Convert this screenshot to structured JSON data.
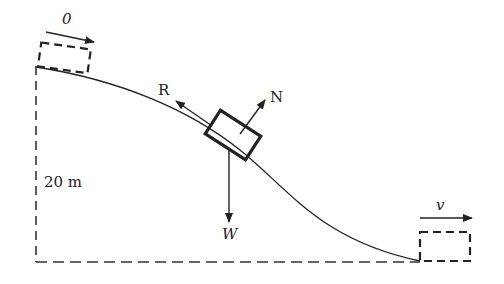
{
  "diagram": {
    "type": "physics-free-body",
    "labels": {
      "initial_speed": "0",
      "final_speed": "v",
      "height": "20 m",
      "friction_force": "R",
      "normal_force": "N",
      "weight": "W"
    },
    "colors": {
      "line": "#222222",
      "dashed": "#333333",
      "background": "#ffffff"
    }
  }
}
